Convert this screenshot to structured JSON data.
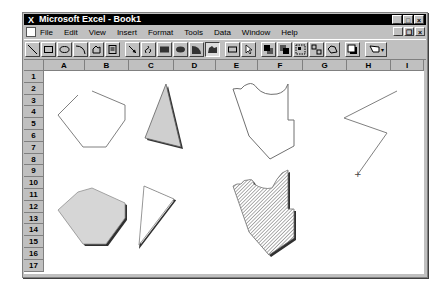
{
  "window": {
    "title": "Microsoft Excel - Book1",
    "controls": {
      "minimize": "_",
      "maximize": "□",
      "close": "×"
    },
    "doc_controls": {
      "minimize": "_",
      "restore": "❐",
      "close": "×"
    }
  },
  "menubar": {
    "items": [
      {
        "label": "File"
      },
      {
        "label": "Edit"
      },
      {
        "label": "View"
      },
      {
        "label": "Insert"
      },
      {
        "label": "Format"
      },
      {
        "label": "Tools"
      },
      {
        "label": "Data"
      },
      {
        "label": "Window"
      },
      {
        "label": "Help"
      }
    ]
  },
  "toolbar": {
    "name": "Drawing",
    "buttons": [
      {
        "icon": "line-icon"
      },
      {
        "icon": "rectangle-icon"
      },
      {
        "icon": "ellipse-icon"
      },
      {
        "icon": "arc-icon"
      },
      {
        "icon": "freeform-icon"
      },
      {
        "icon": "text-box-icon"
      },
      {
        "icon": "arrow-icon"
      },
      {
        "icon": "freehand-icon"
      },
      {
        "icon": "filled-rectangle-icon"
      },
      {
        "icon": "filled-ellipse-icon"
      },
      {
        "icon": "filled-arc-icon"
      },
      {
        "icon": "filled-freeform-icon",
        "pressed": true
      },
      {
        "icon": "create-button-icon"
      },
      {
        "icon": "selection-icon"
      },
      {
        "icon": "bring-to-front-icon"
      },
      {
        "icon": "send-to-back-icon"
      },
      {
        "icon": "group-icon"
      },
      {
        "icon": "ungroup-icon"
      },
      {
        "icon": "reshape-icon"
      },
      {
        "icon": "drop-shadow-icon"
      },
      {
        "icon": "pattern-icon"
      }
    ]
  },
  "sheet": {
    "columns": [
      {
        "label": "A",
        "width": 41
      },
      {
        "label": "B",
        "width": 44
      },
      {
        "label": "C",
        "width": 45
      },
      {
        "label": "D",
        "width": 42
      },
      {
        "label": "E",
        "width": 42
      },
      {
        "label": "F",
        "width": 45
      },
      {
        "label": "G",
        "width": 44
      },
      {
        "label": "H",
        "width": 44
      },
      {
        "label": "I",
        "width": 33
      }
    ],
    "rows": [
      "1",
      "2",
      "3",
      "4",
      "5",
      "6",
      "7",
      "8",
      "9",
      "10",
      "11",
      "12",
      "13",
      "14",
      "15",
      "16",
      "17"
    ],
    "row_height": 11.8
  },
  "shapes": {
    "fill_gray": "#d4d4d4",
    "hatch_color": "#7a7a7a",
    "shadow": "#303030",
    "outline": "#606060"
  }
}
